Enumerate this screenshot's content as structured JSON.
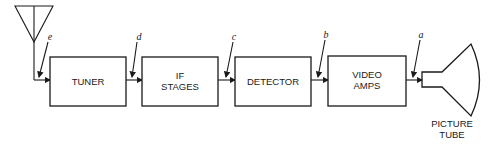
{
  "diagram": {
    "blocks": [
      {
        "id": "tuner",
        "lines": [
          "TUNER"
        ]
      },
      {
        "id": "if",
        "lines": [
          "IF",
          "STAGES"
        ]
      },
      {
        "id": "detector",
        "lines": [
          "DETECTOR"
        ]
      },
      {
        "id": "video",
        "lines": [
          "VIDEO",
          "AMPS"
        ]
      }
    ],
    "test_points": [
      "e",
      "d",
      "c",
      "b",
      "a"
    ],
    "output": {
      "lines": [
        "PICTURE",
        "TUBE"
      ]
    },
    "input_icon": "antenna-icon",
    "output_icon": "picture-tube-icon"
  }
}
